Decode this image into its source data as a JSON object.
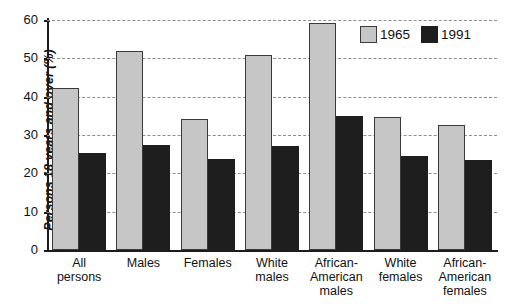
{
  "chart_data": {
    "type": "bar",
    "title": "",
    "xlabel": "",
    "ylabel": "Persons 18 years and over (%)",
    "ylim": [
      0,
      60
    ],
    "ytick_labels": [
      "60",
      "50",
      "40",
      "30",
      "20",
      "10",
      "0"
    ],
    "ytick_values": [
      60,
      50,
      40,
      30,
      20,
      10,
      0
    ],
    "grid": "horizontal dashed gridlines at every 10 units",
    "legend_position": "top-right inside plot",
    "categories": [
      "All persons",
      "Males",
      "Females",
      "White males",
      "African-American males",
      "White females",
      "African-American females"
    ],
    "category_lines": [
      [
        "All",
        "persons"
      ],
      [
        "Males"
      ],
      [
        "Females"
      ],
      [
        "White",
        "males"
      ],
      [
        "African-",
        "American",
        "males"
      ],
      [
        "White",
        "females"
      ],
      [
        "African-",
        "American",
        "females"
      ]
    ],
    "series": [
      {
        "name": "1965",
        "color": "#c6c6c6",
        "values": [
          42.3,
          51.8,
          34.2,
          50.8,
          59.2,
          34.6,
          32.5
        ]
      },
      {
        "name": "1991",
        "color": "#1e1e1e",
        "values": [
          25.4,
          27.5,
          23.7,
          27.1,
          34.9,
          24.5,
          23.4
        ]
      }
    ]
  },
  "legend": {
    "entries": [
      {
        "label": "1965"
      },
      {
        "label": "1991"
      }
    ]
  }
}
